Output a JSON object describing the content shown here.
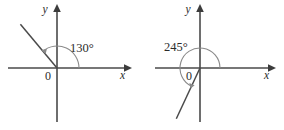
{
  "figure": {
    "background_color": "#ffffff",
    "line_color": "#4a4a4a",
    "arc_color": "#8a8a8a",
    "text_color": "#2b2b2b",
    "degree_symbol": "°",
    "panels": [
      {
        "id": "left-panel",
        "name": "angle-130-diagram",
        "angle_value": "130",
        "angle_label": "130°",
        "origin_label": "0",
        "x_axis_label": "x",
        "y_axis_label": "y",
        "rotation_direction": "counterclockwise",
        "terminal_ray_quadrant": "II",
        "geometry": {
          "origin": [
            57,
            68
          ],
          "x_axis": [
            8,
            128
          ],
          "y_axis": [
            8,
            122
          ],
          "arc_radius": 22,
          "arc_start_deg": 0,
          "arc_end_deg": 130,
          "ray_length": 57
        }
      },
      {
        "id": "right-panel",
        "name": "angle-245-diagram",
        "angle_value": "245",
        "angle_label": "245°",
        "origin_label": "0",
        "x_axis_label": "x",
        "y_axis_label": "y",
        "rotation_direction": "counterclockwise",
        "terminal_ray_quadrant": "III",
        "geometry": {
          "origin": [
            200,
            68
          ],
          "x_axis": [
            155,
            272
          ],
          "y_axis": [
            8,
            122
          ],
          "arc_radius": 20,
          "arc_start_deg": 0,
          "arc_end_deg": 245,
          "ray_length": 56
        }
      }
    ]
  }
}
